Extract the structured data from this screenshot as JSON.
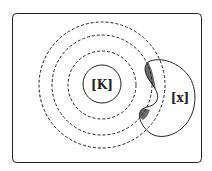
{
  "diagram": {
    "central_label": "[K]",
    "blob_label": "[x]",
    "dashed_circle_count": 3,
    "colors": {
      "stroke": "#222222",
      "shade": "#6b6b6b",
      "background": "#ffffff"
    }
  }
}
